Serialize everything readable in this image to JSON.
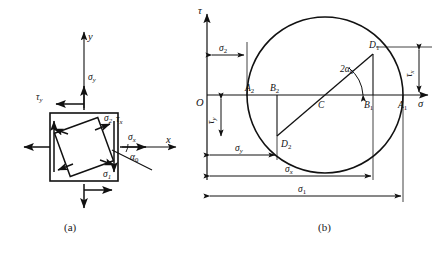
{
  "figure": {
    "background_color": "#ffffff",
    "line_color": "#111111",
    "captions": {
      "left": "(a)",
      "right": "(b)"
    }
  },
  "panel_a": {
    "name": "stress-element",
    "axes": {
      "x_label": "x",
      "y_label": "y"
    },
    "labels": {
      "sigma_y": "σ",
      "sigma_y_sub": "y",
      "sigma_x": "σ",
      "sigma_x_sub": "x",
      "tau_y": "τ",
      "tau_y_sub": "y",
      "tau_x": "τ",
      "tau_x_sub": "x",
      "sigma_1": "σ",
      "sigma_1_sub": "1",
      "sigma_2": "σ",
      "sigma_2_sub": "2",
      "alpha_0": "α",
      "alpha_0_sub": "0"
    },
    "element": {
      "outer_square": "axis-aligned square element",
      "inner_square": "principal-plane element rotated by alpha-0",
      "rotation_deg": -20
    }
  },
  "panel_b": {
    "name": "mohrs-circle",
    "axes": {
      "horizontal_label": "σ",
      "vertical_label": "τ",
      "origin_label": "O"
    },
    "points": [
      {
        "id": "A1",
        "letter": "A",
        "sub": "1",
        "desc": "right sigma-axis intercept, sigma-1"
      },
      {
        "id": "A2",
        "letter": "A",
        "sub": "2",
        "desc": "left sigma-axis intercept, sigma-2"
      },
      {
        "id": "B1",
        "letter": "B",
        "sub": "1",
        "desc": "foot of perpendicular from D1"
      },
      {
        "id": "B2",
        "letter": "B",
        "sub": "2",
        "desc": "foot of perpendicular from D2"
      },
      {
        "id": "C",
        "letter": "C",
        "sub": "",
        "desc": "circle centre"
      },
      {
        "id": "D1",
        "letter": "D",
        "sub": "1",
        "desc": "stress point on x-face"
      },
      {
        "id": "D2",
        "letter": "D",
        "sub": "2",
        "desc": "stress point on y-face"
      }
    ],
    "angle": {
      "label": "2α",
      "sub": "0",
      "desc": "double angle at centre C from sigma axis to C-D1"
    },
    "dimensions": [
      {
        "name": "sigma-2",
        "label": "σ",
        "sub": "2",
        "orientation": "horizontal",
        "position": "top-left"
      },
      {
        "name": "tau-x",
        "label": "τ",
        "sub": "x",
        "orientation": "vertical",
        "position": "right"
      },
      {
        "name": "tau-y",
        "label": "τ",
        "sub": "y",
        "orientation": "vertical",
        "position": "left"
      },
      {
        "name": "sigma-y",
        "label": "σ",
        "sub": "y",
        "orientation": "horizontal",
        "position": "bottom-1"
      },
      {
        "name": "sigma-x",
        "label": "σ",
        "sub": "x",
        "orientation": "horizontal",
        "position": "bottom-2"
      },
      {
        "name": "sigma-1",
        "label": "σ",
        "sub": "1",
        "orientation": "horizontal",
        "position": "bottom-3"
      }
    ],
    "geometry": {
      "center_x": 325,
      "center_y": 95,
      "radius": 78,
      "origin_x": 207,
      "axis_y": 95
    }
  }
}
